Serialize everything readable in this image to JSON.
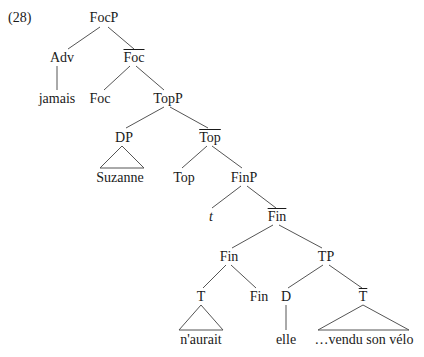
{
  "example_number": "(28)",
  "nodes": {
    "focp": "FocP",
    "adv": "Adv",
    "foc_bar": "Foc",
    "jamais": "jamais",
    "foc": "Foc",
    "topp": "TopP",
    "dp": "DP",
    "top_bar": "Top",
    "suzanne": "Suzanne",
    "top": "Top",
    "finp": "FinP",
    "trace": "t",
    "fin_bar": "Fin",
    "fin_head": "Fin",
    "tp": "TP",
    "t_head": "T",
    "fin_low": "Fin",
    "d": "D",
    "t_bar": "T",
    "naurait": "n'aurait",
    "elle": "elle",
    "vendu": "…vendu son vélo"
  },
  "colors": {
    "line": "#555555",
    "text": "#1a1a1a"
  }
}
